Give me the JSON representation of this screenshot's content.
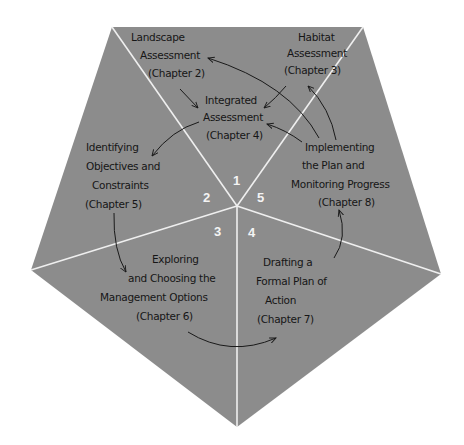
{
  "diagram": {
    "shape": "pentagon",
    "fill_color": "#8c8c8c",
    "divider_color": "#efefef",
    "text_color": "#161616",
    "number_color": "#f4f4f4",
    "sectors": [
      {
        "number": "1"
      },
      {
        "number": "2"
      },
      {
        "number": "3"
      },
      {
        "number": "4"
      },
      {
        "number": "5"
      }
    ],
    "nodes": {
      "landscape": {
        "lines": [
          "Landscape",
          "Assessment",
          "(Chapter 2)"
        ]
      },
      "habitat": {
        "lines": [
          "Habitat",
          "Assessment",
          "(Chapter 3)"
        ]
      },
      "integrated": {
        "lines": [
          "Integrated",
          "Assessment",
          "(Chapter 4)"
        ]
      },
      "objectives": {
        "lines": [
          "Identifying",
          "Objectives and",
          "Constraints",
          "(Chapter 5)"
        ]
      },
      "options": {
        "lines": [
          "Exploring",
          "and Choosing the",
          "Management Options",
          "(Chapter 6)"
        ]
      },
      "plan": {
        "lines": [
          "Drafting a",
          "Formal Plan of",
          "Action",
          "(Chapter 7)"
        ]
      },
      "implementing": {
        "lines": [
          "Implementing",
          "the Plan and",
          "Monitoring Progress",
          "(Chapter 8)"
        ]
      }
    },
    "arrows": [
      {
        "from": "landscape",
        "to": "integrated"
      },
      {
        "from": "habitat",
        "to": "integrated"
      },
      {
        "from": "integrated",
        "to": "objectives"
      },
      {
        "from": "objectives",
        "to": "options"
      },
      {
        "from": "options",
        "to": "plan"
      },
      {
        "from": "plan",
        "to": "implementing"
      },
      {
        "from": "implementing",
        "to": "integrated"
      },
      {
        "from": "implementing",
        "to": "landscape"
      },
      {
        "from": "implementing",
        "to": "habitat"
      }
    ]
  }
}
